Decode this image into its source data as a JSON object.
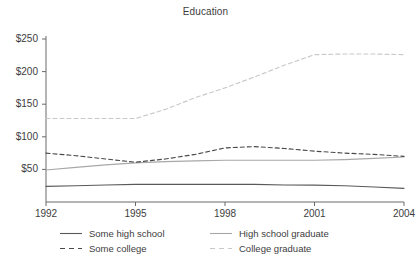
{
  "chart_data": {
    "type": "line",
    "title": "Education",
    "xlabel": "",
    "ylabel": "",
    "x": [
      1992,
      1993,
      1994,
      1995,
      1996,
      1997,
      1998,
      1999,
      2000,
      2001,
      2002,
      2003,
      2004
    ],
    "xlim": [
      1992,
      2004
    ],
    "ylim": [
      0,
      250
    ],
    "xticks": [
      1992,
      1995,
      1998,
      2001,
      2004
    ],
    "xticklabels": [
      "1992",
      "1995",
      "1998",
      "2001",
      "2004"
    ],
    "yticks": [
      50,
      100,
      150,
      200,
      250
    ],
    "yticklabels": [
      "$50",
      "$100",
      "$150",
      "$200",
      "$250"
    ],
    "grid": false,
    "legend_position": "below",
    "series": [
      {
        "name": "Some high school",
        "style": "solid",
        "color": "#5a5a5a",
        "values": [
          24,
          25,
          26,
          27,
          27,
          27,
          27,
          27,
          26,
          26,
          25,
          23,
          21
        ]
      },
      {
        "name": "High school graduate",
        "style": "solid",
        "color": "#a8a8a8",
        "values": [
          49,
          53,
          57,
          60,
          62,
          63,
          64,
          64,
          64,
          64,
          65,
          67,
          69
        ]
      },
      {
        "name": "Some college",
        "style": "dashed",
        "color": "#4a4a4a",
        "values": [
          75,
          71,
          66,
          61,
          66,
          73,
          83,
          85,
          82,
          78,
          75,
          73,
          70
        ]
      },
      {
        "name": "College graduate",
        "style": "dashed",
        "color": "#c9c9c9",
        "values": [
          128,
          128,
          128,
          128,
          142,
          160,
          175,
          192,
          210,
          226,
          227,
          227,
          226
        ]
      }
    ]
  },
  "axis": {
    "y_tick_labels": [
      "$250",
      "$200",
      "$150",
      "$100",
      "$50"
    ],
    "x_tick_labels": [
      "1992",
      "1995",
      "1998",
      "2001",
      "2004"
    ]
  },
  "legend": {
    "entries": [
      {
        "label": "Some high school",
        "style": "solid",
        "color": "#5a5a5a"
      },
      {
        "label": "High school graduate",
        "style": "solid",
        "color": "#a8a8a8"
      },
      {
        "label": "Some college",
        "style": "dashed",
        "color": "#4a4a4a"
      },
      {
        "label": "College graduate",
        "style": "dashed",
        "color": "#c9c9c9"
      }
    ]
  }
}
